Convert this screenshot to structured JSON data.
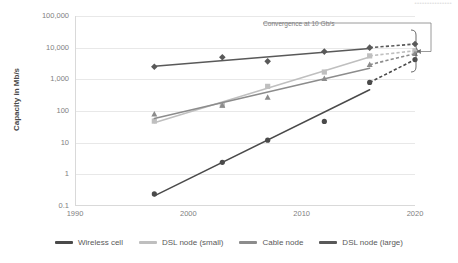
{
  "title_sliver": "•••••••••••••••",
  "axes": {
    "ylabel": "Capacity in Mb/s",
    "yticks": [
      "100,000",
      "10,000",
      "1,000",
      "100",
      "10",
      "1",
      "0.1"
    ],
    "xticks": [
      "1990",
      "2000",
      "2010",
      "2020"
    ]
  },
  "annotation": {
    "text": "Convergence at 10 Gb/s"
  },
  "legend": {
    "items": [
      {
        "label": "Wireless cell",
        "color": "#4a4a4a"
      },
      {
        "label": "DSL node (small)",
        "color": "#bfbfbf"
      },
      {
        "label": "Cable node",
        "color": "#8c8c8c"
      },
      {
        "label": "DSL node (large)",
        "color": "#595959"
      }
    ]
  },
  "chart_data": {
    "type": "scatter",
    "xlabel": "",
    "ylabel": "Capacity in Mb/s",
    "xlim": [
      1990,
      2020
    ],
    "ylim": [
      0.1,
      100000
    ],
    "yscale": "log",
    "grid": true,
    "legend_position": "bottom",
    "annotations": [
      {
        "text": "Convergence at 10 Gb/s",
        "points_to": "2020 convergence bracket",
        "value_mbps": 10000
      }
    ],
    "series": [
      {
        "name": "DSL node (large)",
        "color": "#595959",
        "marker": "diamond",
        "points": [
          {
            "x": 1997,
            "y": 2500
          },
          {
            "x": 2003,
            "y": 5000
          },
          {
            "x": 2007,
            "y": 3700
          },
          {
            "x": 2012,
            "y": 7500
          },
          {
            "x": 2016,
            "y": 10000
          }
        ],
        "projection": {
          "to_x": 2020,
          "to_y": 13000,
          "style": "dashed"
        }
      },
      {
        "name": "DSL node (small)",
        "color": "#bfbfbf",
        "marker": "square",
        "points": [
          {
            "x": 1997,
            "y": 48
          },
          {
            "x": 2003,
            "y": 150
          },
          {
            "x": 2007,
            "y": 600
          },
          {
            "x": 2012,
            "y": 1700
          },
          {
            "x": 2016,
            "y": 5500
          }
        ],
        "projection": {
          "to_x": 2020,
          "to_y": 8000,
          "style": "dashed"
        }
      },
      {
        "name": "Cable node",
        "color": "#8c8c8c",
        "marker": "triangle",
        "points": [
          {
            "x": 1997,
            "y": 80
          },
          {
            "x": 2003,
            "y": 150
          },
          {
            "x": 2007,
            "y": 270
          },
          {
            "x": 2012,
            "y": 1050
          },
          {
            "x": 2016,
            "y": 2900
          }
        ],
        "projection": {
          "to_x": 2020,
          "to_y": 6500,
          "style": "dashed"
        }
      },
      {
        "name": "Wireless cell",
        "color": "#4a4a4a",
        "marker": "circle",
        "points": [
          {
            "x": 1997,
            "y": 0.24
          },
          {
            "x": 2003,
            "y": 2.4
          },
          {
            "x": 2007,
            "y": 12
          },
          {
            "x": 2012,
            "y": 47
          },
          {
            "x": 2016,
            "y": 800
          }
        ],
        "projection": {
          "to_x": 2020,
          "to_y": 4200,
          "style": "dashed"
        }
      }
    ]
  }
}
